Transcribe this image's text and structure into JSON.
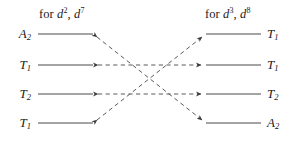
{
  "figure": {
    "kind": "correlation-diagram",
    "title_left": "for d2, d7",
    "title_right": "for d3, d8",
    "headers": {
      "left": {
        "prefix": "for ",
        "sym1": "d",
        "exp1": "2",
        "sep": ", ",
        "sym2": "d",
        "exp2": "7"
      },
      "right": {
        "prefix": "for ",
        "sym1": "d",
        "exp1": "3",
        "sep": ", ",
        "sym2": "d",
        "exp2": "8"
      }
    },
    "left_terms": [
      {
        "letter": "A",
        "sub": "2",
        "row": 1
      },
      {
        "letter": "T",
        "sub": "1",
        "row": 2
      },
      {
        "letter": "T",
        "sub": "2",
        "row": 3
      },
      {
        "letter": "T",
        "sub": "1",
        "row": 4
      }
    ],
    "right_terms": [
      {
        "letter": "T",
        "sub": "1",
        "row": 1
      },
      {
        "letter": "T",
        "sub": "1",
        "row": 2
      },
      {
        "letter": "T",
        "sub": "2",
        "row": 3
      },
      {
        "letter": "A",
        "sub": "2",
        "row": 4
      }
    ],
    "connections": [
      {
        "from": "left-1",
        "to": "right-4",
        "style": "dashed",
        "arrows": "both-ends-reversed"
      },
      {
        "from": "left-4",
        "to": "right-1",
        "style": "dashed",
        "arrows": "both-ends-reversed"
      },
      {
        "from": "left-2",
        "to": "right-2",
        "style": "dashed",
        "arrows": "both"
      },
      {
        "from": "left-3",
        "to": "right-3",
        "style": "dashed",
        "arrows": "both"
      }
    ],
    "colors": {
      "ink": "#1b1b1b",
      "stroke": "#3a3a3a",
      "background": "#ffffff"
    },
    "geometry": {
      "rows_y": [
        34,
        65,
        94,
        123
      ],
      "left_label_x": 31,
      "right_label_x": 267,
      "left_stem_start": 38,
      "left_stem_end": 93,
      "right_stem_start": 206,
      "right_stem_end": 260,
      "left_node_x": 92,
      "right_node_x": 207
    }
  }
}
